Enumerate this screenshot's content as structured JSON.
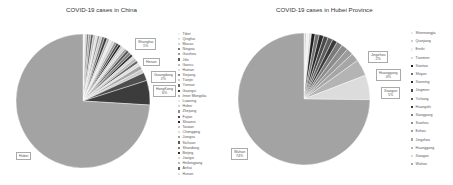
{
  "chart_data": [
    {
      "type": "pie",
      "title": "COVID-19 cases in China",
      "legend_position": "right",
      "start_angle_deg": 0,
      "center": [
        83,
        101
      ],
      "radius": 67,
      "categories": [
        "Tibet",
        "Qinghai",
        "Macau",
        "Ningxia",
        "Guizhou",
        "Jilin",
        "Gansu",
        "Hainan",
        "Xinjiang",
        "Tianjin",
        "Yunnan",
        "Guangxi",
        "Inner Mongolia",
        "Liaoning",
        "Hebei",
        "Zhejiang",
        "Fujian",
        "Shaanxi",
        "Taiwan",
        "Chongqing",
        "Jiangsu",
        "Sichuan",
        "Shandong",
        "Beijing",
        "Jiangxi",
        "Heilongjiang",
        "Anhui",
        "Hunan",
        "Shanghai",
        "Henan",
        "Guangdong",
        "Hong Kong",
        "Hubei"
      ],
      "values": [
        0.15,
        0.35,
        0.4,
        0.5,
        0.5,
        0.6,
        0.6,
        0.5,
        0.5,
        0.6,
        0.6,
        0.7,
        0.6,
        0.6,
        0.7,
        0.6,
        0.6,
        0.6,
        0.5,
        0.7,
        0.6,
        0.7,
        0.7,
        0.6,
        0.7,
        0.7,
        0.7,
        0.8,
        1.0,
        0.9,
        2.0,
        6.0,
        75.0
      ],
      "colors": [
        "#f2f2f2",
        "#e3e3e3",
        "#cfcfcf",
        "#7a7a7a",
        "#9a9a9a",
        "#5a5a5a",
        "#bdbdbd",
        "#dedede",
        "#8a8a8a",
        "#c8c8c8",
        "#6a6a6a",
        "#3a3a3a",
        "#b0b0b0",
        "#e8e8e8",
        "#d4d4d4",
        "#909090",
        "#4a4a4a",
        "#252525",
        "#c0c0c0",
        "#dcdcdc",
        "#a0a0a0",
        "#585858",
        "#7e7e7e",
        "#303030",
        "#d8d8d8",
        "#b8b8b8",
        "#686868",
        "#e0e0e0",
        "#a8a8a8",
        "#cccccc",
        "#4e4e4e",
        "#3c3c3c",
        "#a3a3a3"
      ],
      "data_labels": [
        {
          "category": "Shanghai",
          "lines": [
            "Shanghai",
            "1%"
          ],
          "x": 135,
          "y": 38
        },
        {
          "category": "Henan",
          "lines": [
            "Henan"
          ],
          "x": 143,
          "y": 58
        },
        {
          "category": "Guangdong",
          "lines": [
            "Guangdong",
            "2%"
          ],
          "x": 151,
          "y": 71
        },
        {
          "category": "Hong Kong",
          "lines": [
            "HongKong",
            "6%"
          ],
          "x": 153,
          "y": 85
        },
        {
          "category": "Hubei",
          "lines": [
            "Hubei"
          ],
          "x": 16,
          "y": 152
        }
      ],
      "legend": [
        "Tibet",
        "Qinghai",
        "Macau",
        "Ningxia",
        "Guizhou",
        "Jilin",
        "Gansu",
        "Hainan",
        "Xinjiang",
        "Tianjin",
        "Yunnan",
        "Guangxi",
        "Inner Mongolia",
        "Liaoning",
        "Hebei",
        "Zhejiang",
        "Fujian",
        "Shaanxi",
        "Taiwan",
        "Chongqing",
        "Jiangsu",
        "Sichuan",
        "Shandong",
        "Beijing",
        "Jiangxi",
        "Heilongjiang",
        "Anhui",
        "Hunan"
      ]
    },
    {
      "type": "pie",
      "title": "COVID-19 cases in Hubei Province",
      "legend_position": "right",
      "start_angle_deg": 0,
      "center": [
        78,
        99
      ],
      "radius": 66,
      "categories": [
        "Shennongjia",
        "Qianjiang",
        "Enshi",
        "Tianmen",
        "Xiantao",
        "Shiyan",
        "Xianning",
        "Jingmen",
        "Yichang",
        "Huangshi",
        "Xiangyang",
        "Suizhou",
        "Ezhou",
        "Jingzhou",
        "Huanggang",
        "Xiaogan",
        "Wuhan"
      ],
      "values": [
        0.1,
        0.5,
        0.6,
        0.6,
        0.9,
        1.0,
        1.1,
        1.1,
        1.2,
        1.2,
        1.4,
        1.6,
        1.6,
        2.0,
        4.0,
        6.0,
        74.0
      ],
      "colors": [
        "#e8e8e8",
        "#d0d0d0",
        "#f0f0f0",
        "#dadada",
        "#1e1e1e",
        "#6e6e6e",
        "#2a2a2a",
        "#4a4a4a",
        "#5e5e5e",
        "#3a3a3a",
        "#7a7a7a",
        "#8c8c8c",
        "#9c9c9c",
        "#a6a6a6",
        "#b4b4b4",
        "#dcdcdc",
        "#a3a3a3"
      ],
      "data_labels": [
        {
          "category": "Jingzhou",
          "lines": [
            "Jingzhou",
            "2%"
          ],
          "x": 142,
          "y": 51
        },
        {
          "category": "Huanggang",
          "lines": [
            "Huanggang",
            "4%"
          ],
          "x": 150,
          "y": 69
        },
        {
          "category": "Xiaogan",
          "lines": [
            "Xiaogan",
            "5%"
          ],
          "x": 155,
          "y": 87
        },
        {
          "category": "Wuhan",
          "lines": [
            "Wuhan",
            "74%"
          ],
          "x": 5,
          "y": 148
        }
      ],
      "legend": [
        "Shennongjia",
        "Qianjiang",
        "Enshi",
        "Tianmen",
        "Xiantao",
        "Shiyan",
        "Xianning",
        "Jingmen",
        "Yichang",
        "Huangshi",
        "Xiangyang",
        "Suizhou",
        "Ezhou",
        "Jingzhou",
        "Huanggang",
        "Xiaogan",
        "Wuhan"
      ]
    }
  ]
}
